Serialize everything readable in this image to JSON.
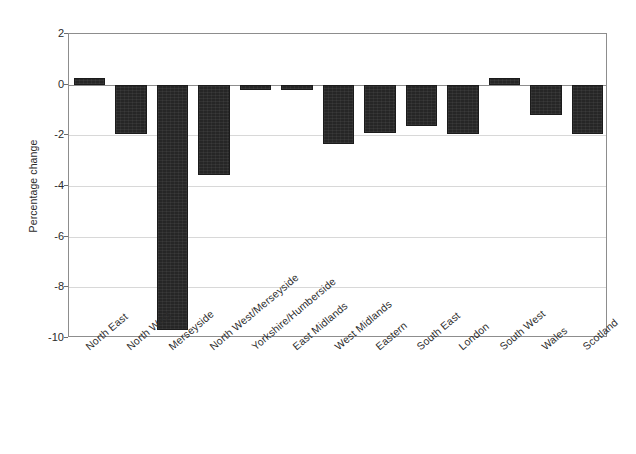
{
  "chart_data": {
    "type": "bar",
    "title": "",
    "subtitle": "",
    "xlabel": "",
    "ylabel": "Percentage change",
    "ylim": [
      -10,
      2
    ],
    "yticks": [
      2,
      0,
      -2,
      -4,
      -6,
      -8,
      -10
    ],
    "ytick_labels": [
      "2",
      "0",
      "-2",
      "-4",
      "-6",
      "-8",
      "-10"
    ],
    "grid": true,
    "grid_axis": "y",
    "legend": false,
    "legend_position": "none",
    "bar_color": "#262626",
    "categories": [
      "North East",
      "North West",
      "Merseyside",
      "North West/Merseyside",
      "Yorkshire/Humberside",
      "East Midlands",
      "West Midlands",
      "Eastern",
      "South East",
      "London",
      "South West",
      "Wales",
      "Scotland"
    ],
    "values": [
      0.25,
      -1.95,
      -9.7,
      -3.55,
      -0.2,
      -0.2,
      -2.35,
      -1.9,
      -1.65,
      -1.95,
      0.25,
      -1.2,
      -1.95
    ]
  },
  "axes": {
    "y_title": "Percentage change"
  }
}
